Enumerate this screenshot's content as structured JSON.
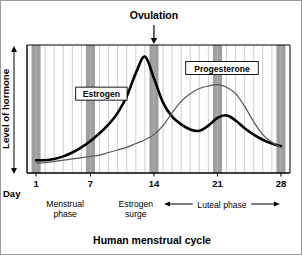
{
  "figure": {
    "title": "Human menstrual cycle",
    "callout": {
      "label": "Ovulation",
      "day": 14
    }
  },
  "chart_data": {
    "type": "line",
    "title": "Human menstrual cycle",
    "xlabel": "Day",
    "ylabel": "Level of hormone",
    "xlim": [
      0,
      29
    ],
    "ylim": [
      0,
      100
    ],
    "grid": true,
    "grid_orientation": "vertical",
    "grid_step_days": 1,
    "legend_position": "inline-boxed-labels",
    "xticks": [
      1,
      7,
      14,
      21,
      28
    ],
    "xticklabels": [
      "1",
      "7",
      "14",
      "21",
      "28"
    ],
    "yticks": [],
    "yticklabels": [],
    "shaded_bands": [
      {
        "day": 1,
        "color": "#9e9e9e"
      },
      {
        "day": 7,
        "color": "#9e9e9e"
      },
      {
        "day": 14,
        "color": "#9e9e9e"
      },
      {
        "day": 21,
        "color": "#9e9e9e"
      },
      {
        "day": 28,
        "color": "#9e9e9e"
      }
    ],
    "series": [
      {
        "name": "Estrogen",
        "color": "#000000",
        "width": 2.6,
        "label_box": true,
        "label_day": 8.2,
        "label_level": 62,
        "x": [
          1,
          2,
          3,
          4,
          5,
          6,
          7,
          8,
          9,
          10,
          11,
          12,
          13,
          14,
          15,
          16,
          17,
          18,
          19,
          20,
          21,
          22,
          23,
          24,
          25,
          26,
          27,
          28
        ],
        "values": [
          10,
          10,
          11,
          13,
          16,
          20,
          25,
          31,
          38,
          47,
          60,
          78,
          91,
          74,
          55,
          44,
          38,
          34,
          33,
          37,
          43,
          45,
          41,
          35,
          30,
          26,
          23,
          21
        ]
      },
      {
        "name": "Progesterone",
        "color": "#555555",
        "width": 1.2,
        "label_box": true,
        "label_day": 21.5,
        "label_level": 82,
        "x": [
          1,
          2,
          3,
          4,
          5,
          6,
          7,
          8,
          9,
          10,
          11,
          12,
          13,
          14,
          15,
          16,
          17,
          18,
          19,
          20,
          21,
          22,
          23,
          24,
          25,
          26,
          27,
          28
        ],
        "values": [
          8,
          8,
          9,
          10,
          11,
          12,
          13,
          14,
          16,
          18,
          20,
          23,
          26,
          30,
          37,
          47,
          56,
          62,
          66,
          68,
          69,
          67,
          62,
          52,
          40,
          30,
          24,
          20
        ]
      }
    ],
    "annotations": [
      {
        "name": "ovulation",
        "text": "Ovulation",
        "day": 14,
        "type": "arrow-down"
      },
      {
        "name": "menstrual-phase",
        "text": "Menstrual\nphase",
        "line1": "Menstrual",
        "line2": "phase",
        "day": 4.2,
        "type": "text"
      },
      {
        "name": "estrogen-surge",
        "text": "Estrogen\nsurge",
        "line1": "Estrogen",
        "line2": "surge",
        "day": 12.0,
        "type": "text"
      },
      {
        "name": "luteal-phase",
        "text": "Luteal phase",
        "day_start": 15.0,
        "day_end": 28.0,
        "type": "double-arrow"
      }
    ]
  }
}
